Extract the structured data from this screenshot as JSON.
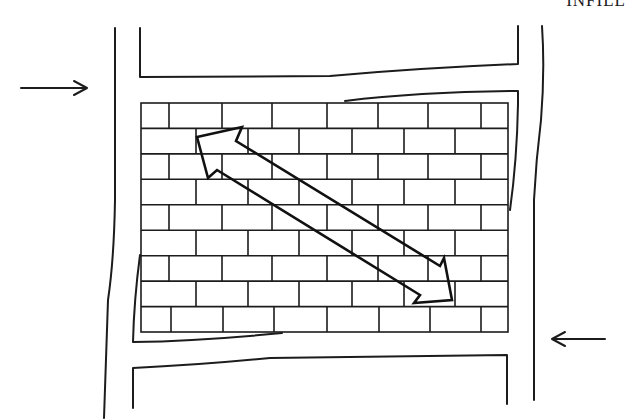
{
  "figure": {
    "title": "INFILL",
    "colors": {
      "stroke": "#1c1c1c",
      "background": "#ffffff"
    },
    "load_arrows": [
      {
        "id": "left-load",
        "direction": "right"
      },
      {
        "id": "right-load",
        "direction": "left"
      }
    ],
    "brick_rows": 9,
    "strut": {
      "type": "double-headed-arrow",
      "orientation": "diagonal top-left to bottom-right"
    }
  }
}
